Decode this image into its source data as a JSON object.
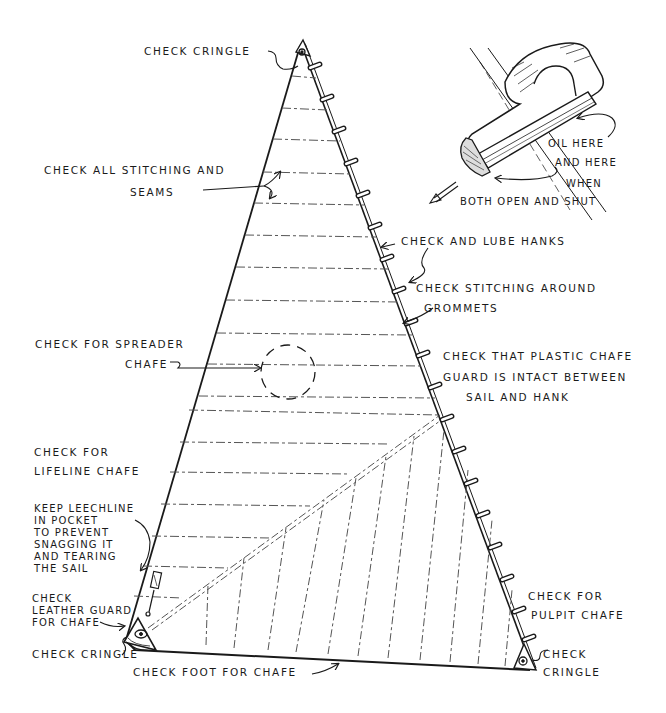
{
  "figure": {
    "colors": {
      "ink": "#1a1a1a",
      "background": "#ffffff",
      "seam": "#555555"
    }
  },
  "labels": {
    "head_cringle": "CHECK CRINGLE",
    "stitching": [
      "CHECK ALL STITCHING AND",
      "SEAMS"
    ],
    "hank_oil": [
      "OIL HERE",
      "AND HERE",
      "WHEN",
      "BOTH OPEN AND SHUT"
    ],
    "lube_hanks": "CHECK AND LUBE HANKS",
    "grommets": [
      "CHECK STITCHING AROUND",
      "GROMMETS"
    ],
    "spreader": [
      "CHECK FOR SPREADER",
      "CHAFE"
    ],
    "plastic_guard": [
      "CHECK THAT PLASTIC CHAFE",
      "GUARD IS INTACT BETWEEN",
      "SAIL AND HANK"
    ],
    "lifeline": [
      "CHECK FOR",
      "LIFELINE CHAFE"
    ],
    "leechline": [
      "KEEP LEECHLINE",
      "IN POCKET",
      "TO PREVENT",
      "SNAGGING IT",
      "AND TEARING",
      "THE SAIL"
    ],
    "leather_guard": [
      "CHECK",
      "LEATHER GUARD",
      "FOR CHAFE"
    ],
    "tack_cringle": "CHECK CRINGLE",
    "foot": "CHECK FOOT FOR CHAFE",
    "pulpit": [
      "CHECK FOR",
      "PULPIT CHAFE"
    ],
    "clew_cringle": [
      "CHECK",
      "CRINGLE"
    ]
  },
  "icons": {
    "hank_detail": "piston-hank-illustration",
    "direction_arrow": "arrow-down-left",
    "spreader_zone": "dashed-circle"
  }
}
